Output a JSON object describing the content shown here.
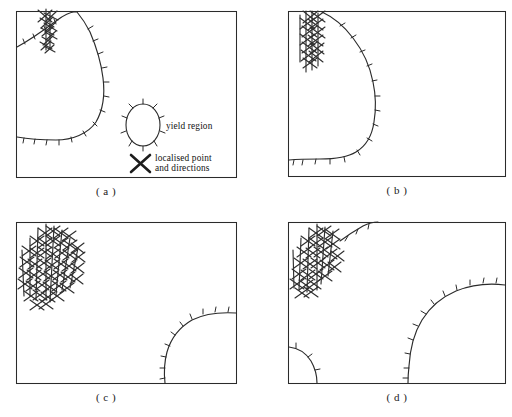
{
  "figure": {
    "title": "",
    "panel_count": 4,
    "background_color": "#ffffff",
    "ink_color": "#2b2b2b"
  },
  "panels": [
    {
      "id": "a",
      "label": "( a )",
      "frame": {
        "x": 16,
        "y": 11,
        "w": 220,
        "h": 166
      },
      "description": "single yield region in upper-left, small localised point cluster"
    },
    {
      "id": "b",
      "label": "( b )",
      "frame": {
        "x": 288,
        "y": 11,
        "w": 217,
        "h": 165
      },
      "description": "large yield region spanning left and bottom, dense vertical localised cluster"
    },
    {
      "id": "c",
      "label": "( c )",
      "frame": {
        "x": 16,
        "y": 222,
        "w": 220,
        "h": 161
      },
      "description": "dense cross-hatch fan upper-left plus quarter-circle yield region lower-right"
    },
    {
      "id": "d",
      "label": "( d )",
      "frame": {
        "x": 288,
        "y": 222,
        "w": 217,
        "h": 161
      },
      "description": "cross-hatch cluster upper-left, arc upper-right, large arc lower-right, small corner arc lower-left"
    }
  ],
  "legend": {
    "items": [
      {
        "symbol": "ellipse-with-radial-ticks",
        "label": "yield region"
      },
      {
        "symbol": "x-cross",
        "label": "localised point",
        "label2": "and directions"
      }
    ]
  }
}
